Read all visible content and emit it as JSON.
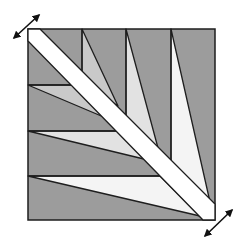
{
  "diagram": {
    "type": "quilt-block-feather-fan",
    "width": 241,
    "height": 242,
    "colors": {
      "background": "#ffffff",
      "dark": "#9c9c9c",
      "light1": "#c9c9c9",
      "light2": "#e2e2e2",
      "light3": "#f4f4f4",
      "band": "#ffffff",
      "stroke": "#1e1e1e"
    },
    "square": {
      "points": "28,29 215,29 215,220 28,220"
    },
    "spikes": [
      {
        "id": "top-spike-1",
        "fill": "light1",
        "points": "82,29 82,82 118,106"
      },
      {
        "id": "top-spike-2",
        "fill": "light2",
        "points": "126,29 126,116 158,148"
      },
      {
        "id": "top-spike-3",
        "fill": "light3",
        "points": "171,29 171,162 210,202"
      },
      {
        "id": "left-spike-1",
        "fill": "light1",
        "points": "28,85 75,85 106,118"
      },
      {
        "id": "left-spike-2",
        "fill": "light2",
        "points": "28,131 118,131 148,160"
      },
      {
        "id": "left-spike-3",
        "fill": "light3",
        "points": "28,176 160,176 200,216"
      }
    ],
    "band": {
      "points": "40,29 215,204 215,220 203,220 28,41 28,29"
    },
    "lines": [
      {
        "id": "top-vertical-1",
        "points": "82,29 82,82"
      },
      {
        "id": "top-vertical-2",
        "points": "126,29 126,116"
      },
      {
        "id": "top-vertical-3",
        "points": "171,29 171,162"
      },
      {
        "id": "left-horizontal-1",
        "points": "28,85 75,85"
      },
      {
        "id": "left-horizontal-2",
        "points": "28,131 118,131"
      },
      {
        "id": "left-horizontal-3",
        "points": "28,176 160,176"
      }
    ],
    "arrows": [
      {
        "id": "top-left-arrow",
        "x1": 14,
        "y1": 38,
        "x2": 39,
        "y2": 15
      },
      {
        "id": "bottom-right-arrow",
        "x1": 205,
        "y1": 236,
        "x2": 232,
        "y2": 210
      }
    ]
  }
}
